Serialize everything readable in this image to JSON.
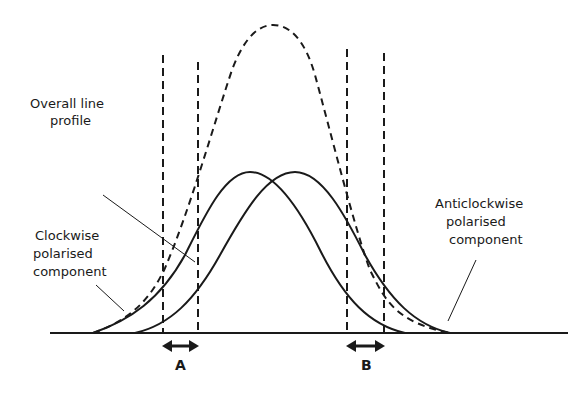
{
  "diagram": {
    "labels": {
      "overall_line_1": "Overall line",
      "overall_line_2": "profile",
      "clockwise_1": "Clockwise",
      "clockwise_2": "polarised",
      "clockwise_3": "component",
      "anticlockwise_1": "Anticlockwise",
      "anticlockwise_2": "polarised",
      "anticlockwise_3": "component",
      "region_a": "A",
      "region_b": "B"
    },
    "elements": [
      {
        "id": "baseline",
        "type": "axis-line"
      },
      {
        "id": "clockwise-curve",
        "type": "solid-curve",
        "peak_x": 250
      },
      {
        "id": "anticlockwise-curve",
        "type": "solid-curve",
        "peak_x": 295
      },
      {
        "id": "overall-profile",
        "type": "dashed-curve",
        "peak_x": 273
      },
      {
        "id": "window-a",
        "type": "dashed-verticals",
        "x": [
          163,
          198
        ]
      },
      {
        "id": "window-b",
        "type": "dashed-verticals",
        "x": [
          347,
          384
        ]
      }
    ],
    "colors": {
      "ink": "#1a1a1a",
      "background": "#ffffff"
    }
  }
}
